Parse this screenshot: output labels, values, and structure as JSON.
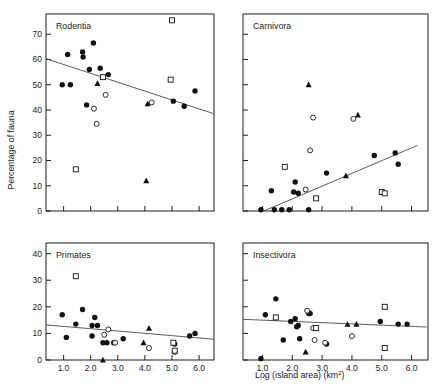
{
  "figure": {
    "xlabel_main": "Log (island area)",
    "xlabel_units": "(km",
    "xlabel_units_sup": "2",
    "xlabel_units_close": ")",
    "ylabel": "Percentage of fauna"
  },
  "chart_data": [
    {
      "type": "scatter",
      "title": "Rodentia",
      "xlabel": "Log (island area) (km2)",
      "ylabel": "Percentage of fauna",
      "xlim": [
        0.35,
        6.55
      ],
      "ylim": [
        0,
        78
      ],
      "grid": false,
      "xticks": [
        1.0,
        2.0,
        3.0,
        4.0,
        5.0,
        6.0
      ],
      "xticklabels": [
        "",
        "",
        "",
        "",
        "",
        ""
      ],
      "yticks": [
        0,
        10,
        20,
        30,
        40,
        50,
        60,
        70
      ],
      "yticklabels": [
        "0",
        "10",
        "20",
        "30",
        "40",
        "50",
        "60",
        "70"
      ],
      "series": [
        {
          "name": "filled-circle",
          "marker": "filled-circle",
          "points": [
            [
              0.95,
              50.0
            ],
            [
              1.25,
              50.0
            ],
            [
              1.15,
              62.0
            ],
            [
              1.7,
              63.0
            ],
            [
              1.72,
              61.0
            ],
            [
              2.1,
              66.5
            ],
            [
              1.95,
              56.0
            ],
            [
              2.35,
              56.5
            ],
            [
              2.65,
              54.0
            ],
            [
              1.85,
              42.0
            ],
            [
              5.05,
              43.5
            ],
            [
              5.45,
              41.5
            ],
            [
              5.85,
              47.5
            ]
          ]
        },
        {
          "name": "open-circle",
          "marker": "open-circle",
          "points": [
            [
              2.55,
              46.0
            ],
            [
              2.12,
              40.5
            ],
            [
              2.22,
              34.5
            ],
            [
              4.25,
              43.0
            ]
          ]
        },
        {
          "name": "filled-triangle",
          "marker": "filled-triangle",
          "points": [
            [
              2.25,
              50.5
            ],
            [
              4.1,
              42.5
            ],
            [
              4.05,
              12.0
            ]
          ]
        },
        {
          "name": "open-square",
          "marker": "open-square",
          "points": [
            [
              2.45,
              53.0
            ],
            [
              5.0,
              75.5
            ],
            [
              4.95,
              52.0
            ],
            [
              1.45,
              16.5
            ]
          ]
        }
      ],
      "fit_line": {
        "x0": 0.35,
        "y0": 60.3,
        "x1": 6.55,
        "y1": 38.5
      }
    },
    {
      "type": "scatter",
      "title": "Carnivora",
      "xlabel": "Log (island area) (km2)",
      "ylabel": "Percentage of fauna",
      "xlim": [
        0.35,
        6.55
      ],
      "ylim": [
        0,
        78
      ],
      "grid": false,
      "xticks": [
        1.0,
        2.0,
        3.0,
        4.0,
        5.0,
        6.0
      ],
      "xticklabels": [
        "",
        "",
        "",
        "",
        "",
        ""
      ],
      "yticks": [
        0,
        10,
        20,
        30,
        40,
        50,
        60,
        70
      ],
      "yticklabels": [
        "",
        "",
        "",
        "",
        "",
        "",
        "",
        ""
      ],
      "series": [
        {
          "name": "filled-circle",
          "marker": "filled-circle",
          "points": [
            [
              0.95,
              0.5
            ],
            [
              1.4,
              0.5
            ],
            [
              1.65,
              0.5
            ],
            [
              1.9,
              0.5
            ],
            [
              2.55,
              0.5
            ],
            [
              1.3,
              8.0
            ],
            [
              2.1,
              11.5
            ],
            [
              2.05,
              7.5
            ],
            [
              2.2,
              7.0
            ],
            [
              3.15,
              15.0
            ],
            [
              4.75,
              22.0
            ],
            [
              5.45,
              23.0
            ],
            [
              5.55,
              18.5
            ]
          ]
        },
        {
          "name": "open-circle",
          "marker": "open-circle",
          "points": [
            [
              2.7,
              37.0
            ],
            [
              2.6,
              24.0
            ],
            [
              4.05,
              36.5
            ],
            [
              2.45,
              8.5
            ]
          ]
        },
        {
          "name": "filled-triangle",
          "marker": "filled-triangle",
          "points": [
            [
              2.55,
              50.0
            ],
            [
              4.2,
              38.0
            ],
            [
              3.8,
              14.0
            ]
          ]
        },
        {
          "name": "open-square",
          "marker": "open-square",
          "points": [
            [
              1.75,
              17.5
            ],
            [
              2.8,
              5.0
            ],
            [
              5.0,
              7.5
            ],
            [
              5.1,
              7.0
            ]
          ]
        }
      ],
      "fit_line": {
        "x0": 1.05,
        "y0": 0.0,
        "x1": 6.2,
        "y1": 26.0
      }
    },
    {
      "type": "scatter",
      "title": "Primates",
      "xlabel": "Log (island area) (km2)",
      "ylabel": "Percentage of fauna",
      "xlim": [
        0.35,
        6.55
      ],
      "ylim": [
        0,
        44
      ],
      "grid": false,
      "xticks": [
        1.0,
        2.0,
        3.0,
        4.0,
        5.0,
        6.0
      ],
      "xticklabels": [
        "1.0",
        "2.0",
        "3.0",
        "4.0",
        "5.0",
        "6.0"
      ],
      "yticks": [
        0,
        10,
        20,
        30,
        40
      ],
      "yticklabels": [
        "0",
        "10",
        "20",
        "30",
        "40"
      ],
      "series": [
        {
          "name": "filled-circle",
          "marker": "filled-circle",
          "points": [
            [
              0.95,
              17.0
            ],
            [
              1.1,
              8.5
            ],
            [
              1.45,
              13.5
            ],
            [
              1.7,
              19.0
            ],
            [
              2.05,
              13.0
            ],
            [
              2.15,
              16.0
            ],
            [
              2.25,
              13.0
            ],
            [
              2.05,
              9.0
            ],
            [
              2.45,
              6.5
            ],
            [
              2.6,
              6.5
            ],
            [
              2.85,
              6.5
            ],
            [
              3.2,
              8.0
            ],
            [
              5.1,
              6.0
            ],
            [
              5.65,
              9.0
            ],
            [
              5.85,
              10.0
            ]
          ]
        },
        {
          "name": "open-circle",
          "marker": "open-circle",
          "points": [
            [
              2.5,
              9.5
            ],
            [
              2.65,
              11.5
            ],
            [
              2.9,
              6.5
            ],
            [
              4.15,
              4.5
            ],
            [
              5.1,
              3.0
            ]
          ]
        },
        {
          "name": "filled-triangle",
          "marker": "filled-triangle",
          "points": [
            [
              2.45,
              0.0
            ],
            [
              3.95,
              6.5
            ],
            [
              4.15,
              12.0
            ]
          ]
        },
        {
          "name": "open-square",
          "marker": "open-square",
          "points": [
            [
              1.45,
              31.5
            ],
            [
              5.05,
              6.5
            ],
            [
              5.1,
              3.5
            ]
          ]
        }
      ],
      "fit_line": {
        "x0": 0.35,
        "y0": 13.2,
        "x1": 6.55,
        "y1": 7.8
      }
    },
    {
      "type": "scatter",
      "title": "Insectivora",
      "xlabel": "Log (island area) (km2)",
      "ylabel": "Percentage of fauna",
      "xlim": [
        0.35,
        6.55
      ],
      "ylim": [
        0,
        44
      ],
      "grid": false,
      "xticks": [
        1.0,
        2.0,
        3.0,
        4.0,
        5.0,
        6.0
      ],
      "xticklabels": [
        "1.0",
        "2.0",
        "3.0",
        "4.0",
        "5.0",
        "6.0"
      ],
      "yticks": [
        0,
        10,
        20,
        30,
        40
      ],
      "yticklabels": [
        "",
        "",
        "",
        "",
        ""
      ],
      "series": [
        {
          "name": "filled-circle",
          "marker": "filled-circle",
          "points": [
            [
              0.95,
              0.5
            ],
            [
              1.1,
              17.0
            ],
            [
              1.45,
              23.0
            ],
            [
              1.95,
              14.5
            ],
            [
              2.1,
              15.5
            ],
            [
              2.15,
              12.5
            ],
            [
              2.2,
              13.0
            ],
            [
              1.7,
              7.5
            ],
            [
              2.25,
              8.0
            ],
            [
              2.55,
              17.5
            ],
            [
              2.6,
              17.5
            ],
            [
              3.15,
              6.0
            ],
            [
              4.95,
              14.5
            ],
            [
              5.55,
              13.5
            ],
            [
              5.85,
              13.5
            ]
          ]
        },
        {
          "name": "open-circle",
          "marker": "open-circle",
          "points": [
            [
              2.5,
              18.5
            ],
            [
              2.7,
              12.0
            ],
            [
              2.75,
              7.5
            ],
            [
              3.1,
              6.5
            ],
            [
              4.0,
              9.0
            ]
          ]
        },
        {
          "name": "filled-triangle",
          "marker": "filled-triangle",
          "points": [
            [
              2.45,
              3.0
            ],
            [
              3.85,
              13.5
            ],
            [
              4.15,
              13.5
            ]
          ]
        },
        {
          "name": "open-square",
          "marker": "open-square",
          "points": [
            [
              1.45,
              16.0
            ],
            [
              2.8,
              12.0
            ],
            [
              5.1,
              20.0
            ],
            [
              5.1,
              4.5
            ]
          ]
        }
      ],
      "fit_line": {
        "x0": 0.35,
        "y0": 15.3,
        "x1": 6.5,
        "y1": 12.4
      }
    }
  ]
}
